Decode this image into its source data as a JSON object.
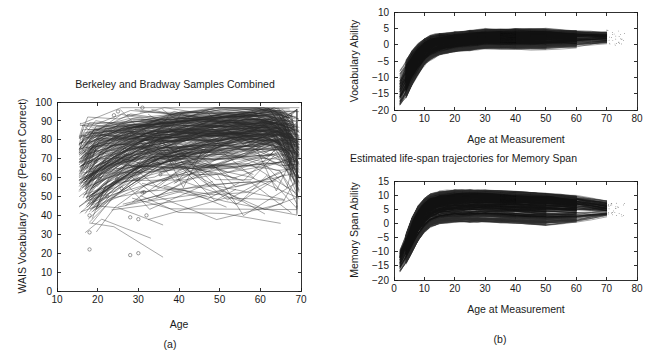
{
  "figure": {
    "caption_a": "(a)",
    "caption_b": "(b)"
  },
  "panel_a": {
    "title": "Berkeley and Bradway Samples Combined",
    "xlabel": "Age",
    "ylabel": "WAIS Vocabulary Score (Percent Correct)",
    "xticks": [
      "10",
      "20",
      "30",
      "40",
      "50",
      "60",
      "70"
    ],
    "yticks": [
      "0",
      "10",
      "20",
      "30",
      "40",
      "50",
      "60",
      "70",
      "80",
      "90",
      "100"
    ]
  },
  "panel_b_top": {
    "title": "",
    "xlabel": "Age at Measurement",
    "ylabel": "Vocabulary Ability",
    "xticks": [
      "0",
      "10",
      "20",
      "30",
      "40",
      "50",
      "60",
      "70",
      "80"
    ],
    "yticks": [
      "-20",
      "-15",
      "-10",
      "-5",
      "0",
      "5",
      "10"
    ]
  },
  "panel_b_bottom": {
    "title": "Estimated life-span trajectories for Memory Span",
    "xlabel": "Age at Measurement",
    "ylabel": "Memory Span Ability",
    "xticks": [
      "0",
      "10",
      "20",
      "30",
      "40",
      "50",
      "60",
      "70",
      "80"
    ],
    "yticks": [
      "-20",
      "-15",
      "-10",
      "-5",
      "0",
      "5",
      "10",
      "15"
    ]
  },
  "chart_data": [
    {
      "id": "panel_a",
      "type": "line",
      "title": "Berkeley and Bradway Samples Combined",
      "xlabel": "Age",
      "ylabel": "WAIS Vocabulary Score (Percent Correct)",
      "xlim": [
        10,
        70
      ],
      "ylim": [
        0,
        100
      ],
      "xticks": [
        10,
        20,
        30,
        40,
        50,
        60,
        70
      ],
      "yticks": [
        0,
        10,
        20,
        30,
        40,
        50,
        60,
        70,
        80,
        90,
        100
      ],
      "grid": false,
      "legend": "none",
      "description": "Spaghetti plot of individual longitudinal WAIS vocabulary trajectories; most observations fall between ages 16 and 70 with scores concentrated between 60 and 92, plus a sparse low cluster of open-circle points between scores 18 and 45 at ages 17-33.",
      "series": [
        {
          "name": "case-1",
          "x": [
            16,
            18,
            26,
            36,
            53,
            61,
            68
          ],
          "y": [
            62,
            70,
            80,
            84,
            86,
            88,
            84
          ]
        },
        {
          "name": "case-2",
          "x": [
            17,
            21,
            30,
            41,
            52,
            64,
            69
          ],
          "y": [
            55,
            66,
            76,
            80,
            83,
            85,
            80
          ]
        },
        {
          "name": "case-3",
          "x": [
            16,
            19,
            25,
            37,
            48,
            60,
            68
          ],
          "y": [
            72,
            78,
            84,
            88,
            90,
            91,
            86
          ]
        },
        {
          "name": "case-4",
          "x": [
            18,
            24,
            31,
            44,
            55,
            63,
            69
          ],
          "y": [
            48,
            58,
            68,
            74,
            78,
            80,
            72
          ]
        },
        {
          "name": "case-5",
          "x": [
            16,
            20,
            29,
            39,
            50,
            62,
            68
          ],
          "y": [
            66,
            74,
            81,
            85,
            87,
            89,
            82
          ]
        },
        {
          "name": "case-6",
          "x": [
            17,
            22,
            33,
            45,
            56,
            65,
            69
          ],
          "y": [
            58,
            67,
            77,
            82,
            84,
            86,
            76
          ]
        },
        {
          "name": "case-7",
          "x": [
            16,
            18,
            27,
            38,
            49,
            61,
            68
          ],
          "y": [
            80,
            84,
            88,
            91,
            92,
            93,
            88
          ]
        },
        {
          "name": "case-8",
          "x": [
            18,
            23,
            32,
            43,
            54,
            64,
            69
          ],
          "y": [
            42,
            52,
            62,
            70,
            74,
            76,
            60
          ]
        },
        {
          "name": "case-9",
          "x": [
            16,
            21,
            30,
            40,
            51,
            62,
            68
          ],
          "y": [
            70,
            77,
            83,
            86,
            88,
            89,
            84
          ]
        },
        {
          "name": "case-10",
          "x": [
            17,
            25,
            35,
            46,
            57,
            66,
            69
          ],
          "y": [
            60,
            72,
            80,
            84,
            86,
            87,
            70
          ]
        },
        {
          "name": "case-11",
          "x": [
            16,
            19,
            28,
            39,
            50,
            60,
            68
          ],
          "y": [
            75,
            80,
            86,
            89,
            90,
            91,
            86
          ]
        },
        {
          "name": "case-12",
          "x": [
            18,
            26,
            36,
            47,
            58,
            65,
            69
          ],
          "y": [
            50,
            63,
            73,
            79,
            82,
            84,
            68
          ]
        },
        {
          "name": "case-13",
          "x": [
            16,
            20,
            31,
            42,
            53,
            63,
            68
          ],
          "y": [
            68,
            76,
            82,
            86,
            88,
            89,
            82
          ]
        },
        {
          "name": "case-14",
          "x": [
            17,
            24,
            34,
            44,
            55,
            64,
            69
          ],
          "y": [
            54,
            65,
            75,
            81,
            84,
            85,
            74
          ]
        },
        {
          "name": "case-15",
          "x": [
            16,
            18,
            29,
            41,
            52,
            62,
            68
          ],
          "y": [
            78,
            83,
            87,
            90,
            91,
            92,
            87
          ]
        },
        {
          "name": "case-16",
          "x": [
            18,
            22,
            33,
            45,
            56,
            66,
            69
          ],
          "y": [
            44,
            55,
            66,
            73,
            77,
            79,
            58
          ]
        },
        {
          "name": "case-17",
          "x": [
            16,
            21,
            32,
            43,
            54,
            63,
            68
          ],
          "y": [
            64,
            73,
            80,
            84,
            87,
            88,
            80
          ]
        },
        {
          "name": "case-18",
          "x": [
            17,
            27,
            37,
            48,
            59,
            65,
            69
          ],
          "y": [
            56,
            70,
            79,
            83,
            85,
            86,
            72
          ]
        },
        {
          "name": "case-19",
          "x": [
            16,
            19,
            26,
            38,
            49,
            61,
            68
          ],
          "y": [
            82,
            85,
            89,
            91,
            92,
            93,
            89
          ]
        },
        {
          "name": "case-20",
          "x": [
            18,
            25,
            35,
            46,
            57,
            64,
            69
          ],
          "y": [
            46,
            59,
            70,
            76,
            80,
            82,
            62
          ]
        },
        {
          "name": "low-1",
          "x": [
            17,
            21,
            27,
            33
          ],
          "y": [
            31,
            38,
            33,
            28
          ]
        },
        {
          "name": "low-2",
          "x": [
            16,
            20,
            25,
            30,
            36
          ],
          "y": [
            42,
            45,
            44,
            40,
            35
          ]
        },
        {
          "name": "low-3",
          "x": [
            18,
            24,
            30,
            36
          ],
          "y": [
            36,
            34,
            26,
            18
          ]
        }
      ],
      "low_points": [
        {
          "x": 18,
          "y": 40
        },
        {
          "x": 18,
          "y": 31
        },
        {
          "x": 18,
          "y": 22
        },
        {
          "x": 28,
          "y": 39
        },
        {
          "x": 30,
          "y": 38
        },
        {
          "x": 32,
          "y": 40
        },
        {
          "x": 28,
          "y": 19
        },
        {
          "x": 30,
          "y": 20
        },
        {
          "x": 24,
          "y": 93
        },
        {
          "x": 25,
          "y": 95
        },
        {
          "x": 31,
          "y": 97
        }
      ]
    },
    {
      "id": "panel_b_top",
      "type": "line",
      "title": "",
      "xlabel": "Age at Measurement",
      "ylabel": "Vocabulary Ability",
      "xlim": [
        0,
        80
      ],
      "ylim": [
        -20,
        10
      ],
      "xticks": [
        0,
        10,
        20,
        30,
        40,
        50,
        60,
        70,
        80
      ],
      "yticks": [
        -20,
        -15,
        -10,
        -5,
        0,
        5,
        10
      ],
      "grid": false,
      "legend": "none",
      "description": "Dense bundle of estimated individual life-span vocabulary-ability growth curves rising steeply from about -20 to -8 at age 2-3 up to a plateau near 0 to 4 by age 15-20, then remaining nearly flat through age 72 with slight late decline.",
      "band": {
        "x": [
          2,
          4,
          6,
          8,
          10,
          12,
          15,
          20,
          25,
          30,
          40,
          50,
          60,
          70,
          75
        ],
        "upper": [
          -8,
          -5,
          -2,
          0,
          1.5,
          2.5,
          3,
          3.5,
          4,
          4.5,
          4.5,
          4.5,
          4,
          3.5,
          3
        ],
        "median": [
          -14,
          -10,
          -6,
          -3,
          -1,
          0.5,
          1.5,
          2,
          2.5,
          3,
          3,
          3,
          2.5,
          2.5,
          2
        ],
        "lower": [
          -19,
          -16,
          -12,
          -9,
          -6,
          -4.5,
          -3,
          -2,
          -1.5,
          -1,
          -1,
          -1,
          -0.5,
          0.5,
          1
        ]
      }
    },
    {
      "id": "panel_b_bottom",
      "type": "line",
      "title": "Estimated life-span trajectories for Memory Span",
      "xlabel": "Age at Measurement",
      "ylabel": "Memory Span Ability",
      "xlim": [
        0,
        80
      ],
      "ylim": [
        -20,
        15
      ],
      "xticks": [
        0,
        10,
        20,
        30,
        40,
        50,
        60,
        70,
        80
      ],
      "yticks": [
        -20,
        -15,
        -10,
        -5,
        0,
        5,
        10,
        15
      ],
      "grid": false,
      "legend": "none",
      "description": "Dense bundle of estimated individual life-span memory-span ability curves rising from about -17 to -9 at age 2-3 to a plateau around 5 to 11 by age 15-20, flat through age 60, then a modest decline toward 4-6 by age 72.",
      "band": {
        "x": [
          2,
          4,
          6,
          8,
          10,
          12,
          15,
          20,
          25,
          30,
          40,
          50,
          60,
          70,
          75
        ],
        "upper": [
          -9,
          -4,
          2,
          6,
          8.5,
          10,
          11,
          11.5,
          11.5,
          11.5,
          11,
          10.5,
          9.5,
          8,
          7
        ],
        "median": [
          -13,
          -8,
          -3,
          1,
          4,
          6,
          7.5,
          8.5,
          9,
          9,
          8.5,
          8,
          7,
          5.5,
          5
        ],
        "lower": [
          -17,
          -14,
          -10,
          -6,
          -3,
          -1,
          0,
          0.5,
          0.5,
          0.5,
          0,
          -0.5,
          0.5,
          2.5,
          3.5
        ]
      }
    }
  ]
}
